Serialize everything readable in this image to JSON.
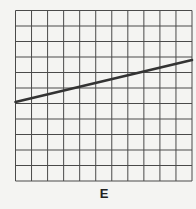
{
  "figure": {
    "label": "E",
    "grid": {
      "columns": 11,
      "rows": 11,
      "line_color": "#4a4a4a",
      "background": "#f4f4f2"
    },
    "line": {
      "color": "#333333",
      "x_start": 0,
      "y_start": 5.1,
      "x_end": 11,
      "y_end": 7.8
    }
  },
  "chart_data": {
    "type": "line",
    "title": "E",
    "xlabel": "",
    "ylabel": "",
    "x": [
      0,
      11
    ],
    "series": [
      {
        "name": "line",
        "values": [
          5.1,
          7.8
        ]
      }
    ],
    "xlim": [
      0,
      11
    ],
    "ylim": [
      0,
      11
    ],
    "grid": true,
    "legend": null
  }
}
